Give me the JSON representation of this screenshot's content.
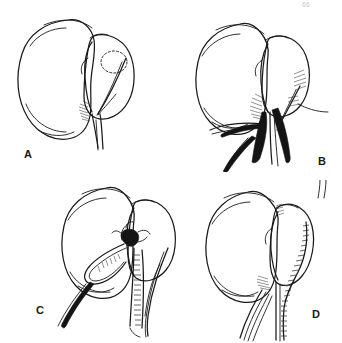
{
  "figure": {
    "domain": "medical-surgical-line-illustration",
    "background_color": "#ffffff",
    "ink_color": "#1a1a1a",
    "layout": "2x2 grid of line-drawing panels",
    "corner_mark": "66"
  },
  "panels": [
    {
      "id": "A",
      "label": "A",
      "label_x": 24,
      "label_y": 148,
      "caption": "Organ with attached lobe; dashed circle marks planned incision site on the lower pole; vascular pedicle exposed below",
      "features": [
        "kidney-shaped main body outline",
        "adjacent rounded lobe",
        "dashed-circle incision marking",
        "hilar shading",
        "pedicle vessels descending"
      ],
      "has_dashed_marking": true,
      "has_ligature": false,
      "has_knot": false,
      "has_suture_line": false
    },
    {
      "id": "B",
      "label": "B",
      "label_x": 318,
      "label_y": 155,
      "caption": "Heavy ligature strands passed around and beneath the vascular pedicle; free ends drawn downward",
      "features": [
        "main body outline",
        "adjacent lobe",
        "dark ligature strands",
        "hatched hilar shading",
        "free suture ends"
      ],
      "has_dashed_marking": false,
      "has_ligature": true,
      "has_knot": false,
      "has_suture_line": false
    },
    {
      "id": "C",
      "label": "C",
      "label_x": 36,
      "label_y": 308,
      "caption": "Ligature tied down as a knot at the pedicle; long free ends trail left while a stitched running line begins on the right",
      "features": [
        "main body outline",
        "adjacent lobe",
        "tied surgical knot",
        "dark trailing suture ends",
        "running stitch line"
      ],
      "has_dashed_marking": false,
      "has_ligature": true,
      "has_knot": true,
      "has_suture_line": true
    },
    {
      "id": "D",
      "label": "D",
      "label_x": 312,
      "label_y": 312,
      "caption": "Completed closure: continuous running suture line along the lobe margin and down the pedicle; vessels intact at left",
      "features": [
        "main body outline",
        "adjacent lobe",
        "continuous running suture line",
        "stitched pedicle closure",
        "remaining vessel strands"
      ],
      "has_dashed_marking": false,
      "has_ligature": false,
      "has_knot": false,
      "has_suture_line": true
    }
  ]
}
